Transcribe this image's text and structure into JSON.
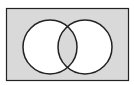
{
  "diagram": {
    "type": "venn",
    "sets": [
      {
        "id": "A",
        "label": ""
      },
      {
        "id": "B",
        "label": ""
      }
    ],
    "shaded_regions": [
      "outside",
      "A∩B"
    ],
    "unshaded_regions": [
      "A only",
      "B only"
    ],
    "colors": {
      "shade": "#d9d9d9",
      "background": "#ffffff",
      "stroke": "#222222"
    }
  }
}
